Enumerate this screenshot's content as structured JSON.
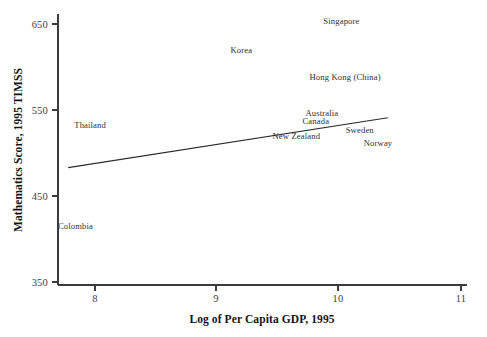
{
  "chart_data": {
    "type": "scatter",
    "title": "",
    "xlabel": "Log of Per Capita GDP, 1995",
    "ylabel": "Mathematics Score, 1995 TIMSS",
    "xlim": [
      7.65,
      11.2
    ],
    "ylim": [
      335,
      672
    ],
    "xticks": [
      "8",
      "9",
      "10",
      "11"
    ],
    "xtick_values": [
      8,
      9,
      10,
      11
    ],
    "yticks": [
      "650",
      "550",
      "450",
      "350"
    ],
    "ytick_values": [
      650,
      550,
      450,
      350
    ],
    "grid": false,
    "legend": "none",
    "marker_style": "text-labels-only",
    "points": [
      {
        "label": "Singapore",
        "x": 10.02,
        "y": 653
      },
      {
        "label": "Korea",
        "x": 9.2,
        "y": 620
      },
      {
        "label": "Hong Kong (China)",
        "x": 10.05,
        "y": 588
      },
      {
        "label": "Australia",
        "x": 9.86,
        "y": 547
      },
      {
        "label": "Canada",
        "x": 9.81,
        "y": 537
      },
      {
        "label": "Sweden",
        "x": 10.17,
        "y": 527
      },
      {
        "label": "New Zealand",
        "x": 9.65,
        "y": 520
      },
      {
        "label": "Norway",
        "x": 10.32,
        "y": 512
      },
      {
        "label": "Thailand",
        "x": 7.96,
        "y": 533
      },
      {
        "label": "Colombia",
        "x": 7.84,
        "y": 415
      }
    ],
    "trend_line": {
      "name": "fitted regression line",
      "x": [
        7.78,
        10.4
      ],
      "y": [
        483,
        541
      ]
    }
  },
  "axes": {
    "y_title": "Mathematics Score, 1995 TIMSS",
    "x_title": "Log of Per Capita GDP, 1995"
  }
}
